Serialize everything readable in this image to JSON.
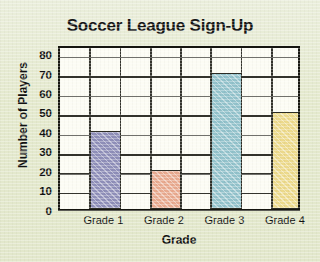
{
  "chart_data": {
    "type": "bar",
    "title": "Soccer League Sign-Up",
    "xlabel": "Grade",
    "ylabel": "Number of Players",
    "categories": [
      "Grade 1",
      "Grade 2",
      "Grade 3",
      "Grade 4"
    ],
    "values": [
      40,
      20,
      70,
      50
    ],
    "ylim": [
      0,
      85
    ],
    "yticks": [
      0,
      10,
      20,
      30,
      40,
      50,
      60,
      70,
      80
    ],
    "ytick_labels": [
      "0",
      "10",
      "20",
      "30",
      "40",
      "50",
      "60",
      "70",
      "80"
    ],
    "grid": true,
    "legend": false,
    "bar_colors": [
      "#8e8eb8",
      "#e8a98e",
      "#92c2cb",
      "#ecd98a"
    ],
    "bar_edge_color": "#2c2c24",
    "plot_background": "#fcfcf4",
    "page_background": "#e4e9cd",
    "axis_color": "#15150f"
  }
}
